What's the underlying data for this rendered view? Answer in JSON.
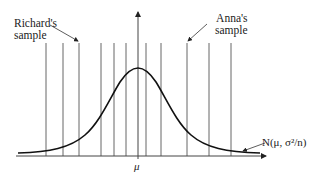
{
  "diagram": {
    "labels": {
      "richard_line1": "Richard's",
      "richard_line2": "sample",
      "anna_line1": "Anna's",
      "anna_line2": "sample",
      "mean": "μ",
      "distribution": "N(μ, σ²/n)"
    },
    "sample_lines_x": [
      46,
      63,
      79,
      101,
      114,
      126,
      146,
      161,
      187,
      209,
      231
    ],
    "mean_axis_x": 138,
    "baseline_y": 156,
    "colors": {
      "line": "#555555",
      "curve": "#111111",
      "text": "#222222"
    }
  }
}
